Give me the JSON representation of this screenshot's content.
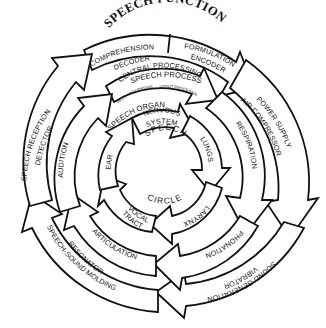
{
  "title": "SPEECH FUNCTION",
  "rings": {
    "outer": {
      "name": "Speech function",
      "segments": [
        {
          "line1": "COMPREHENSION",
          "line2": "DECODER"
        },
        {
          "line1": "FORMULATION",
          "line2": "ENCODER"
        },
        {
          "line1": "POWER SUPPLY",
          "line2": "AIR COMPRESSOR"
        },
        {
          "line1": "SOUND GENERATION",
          "line2": "VIBRATOR"
        },
        {
          "line1": "SPEECH-SOUND MOLDING",
          "line2": "RESONATOR"
        },
        {
          "line1": "SPEECH RECEPTION",
          "line2": "DETECTOR"
        }
      ]
    },
    "process": {
      "name": "SPEECH PROCESS",
      "segments": [
        {
          "label": "CENTRAL PROCESSING",
          "sub_input": "INPUT PROCESSING",
          "sub_output": "OUTPUT PROCESSING"
        },
        {
          "label": "RESPIRATION"
        },
        {
          "label": "PHONATION"
        },
        {
          "label": "ARTICULATION"
        },
        {
          "label": "AUDITION"
        }
      ]
    },
    "organ": {
      "name": "SPEECH ORGAN",
      "segments": [
        {
          "line1": "NERVOUS",
          "line2": "SYSTEM"
        },
        {
          "label": "LUNGS"
        },
        {
          "label": "LARYNX"
        },
        {
          "line1": "VOCAL",
          "line2": "TRACT"
        },
        {
          "label": "EAR"
        }
      ]
    }
  },
  "center": {
    "line1": "SPEECH",
    "line2": "CIRCLE"
  },
  "colors": {
    "stroke": "#111111",
    "fill": "#ffffff"
  }
}
